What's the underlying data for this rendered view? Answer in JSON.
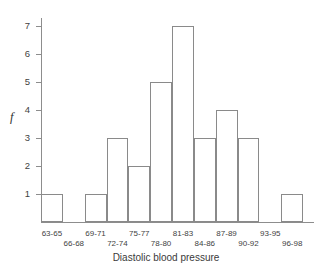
{
  "chart_data": {
    "type": "bar",
    "title": "",
    "xlabel": "Diastolic blood pressure",
    "ylabel": "f",
    "categories": [
      "63-65",
      "66-68",
      "69-71",
      "72-74",
      "75-77",
      "78-80",
      "81-83",
      "84-86",
      "87-89",
      "90-92",
      "93-95",
      "96-98"
    ],
    "values": [
      1,
      0,
      1,
      3,
      2,
      5,
      7,
      3,
      4,
      3,
      0,
      1
    ],
    "ylim": [
      0,
      7.3
    ],
    "ytick_labels": [
      "1",
      "2",
      "3",
      "4",
      "5",
      "6",
      "7"
    ],
    "ytick_values": [
      1,
      2,
      3,
      4,
      5,
      6,
      7
    ],
    "grid": false,
    "legend": "none",
    "bar_fill_color": "#ffffff",
    "bar_edge_color": "#8a8a8a",
    "axis_color": "#8d8d8d",
    "text_color": "#3f3f3f",
    "xlabel_rows": "staggered-two-row",
    "total_frequency": 30
  }
}
